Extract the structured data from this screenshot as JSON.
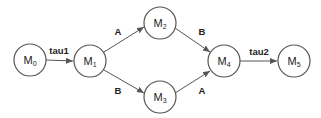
{
  "diagram": {
    "type": "state-transition-graph",
    "nodes": [
      {
        "id": "M0",
        "base": "M",
        "sub": "0",
        "cx": 30,
        "cy": 60
      },
      {
        "id": "M1",
        "base": "M",
        "sub": "1",
        "cx": 90,
        "cy": 61
      },
      {
        "id": "M2",
        "base": "M",
        "sub": "2",
        "cx": 160,
        "cy": 23
      },
      {
        "id": "M3",
        "base": "M",
        "sub": "3",
        "cx": 160,
        "cy": 97
      },
      {
        "id": "M4",
        "base": "M",
        "sub": "4",
        "cx": 224,
        "cy": 61
      },
      {
        "id": "M5",
        "base": "M",
        "sub": "5",
        "cx": 294,
        "cy": 61
      }
    ],
    "edges": [
      {
        "from": "M0",
        "to": "M1",
        "label": "tau1"
      },
      {
        "from": "M1",
        "to": "M2",
        "label": "A"
      },
      {
        "from": "M1",
        "to": "M3",
        "label": "B"
      },
      {
        "from": "M2",
        "to": "M4",
        "label": "B"
      },
      {
        "from": "M3",
        "to": "M4",
        "label": "A"
      },
      {
        "from": "M4",
        "to": "M5",
        "label": "tau2"
      }
    ],
    "colors": {
      "stroke": "#555555",
      "text": "#222222",
      "background": "#ffffff"
    }
  }
}
